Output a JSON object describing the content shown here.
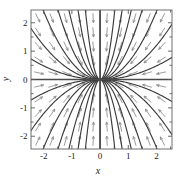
{
  "figure": {
    "kind": "direction-field-phase-portrait",
    "background": "#ffffff"
  },
  "chart_data": {
    "type": "scatter",
    "title": "",
    "subtitle": "",
    "xlabel": "x",
    "ylabel": "y",
    "xlim": [
      -2.45,
      2.55
    ],
    "ylim": [
      -2.45,
      2.45
    ],
    "xticks": [
      -2,
      -1,
      0,
      1,
      2
    ],
    "xticklabels": [
      "-2",
      "-1",
      "0",
      "1",
      "2"
    ],
    "yticks": [
      -2,
      -1,
      0,
      1,
      2
    ],
    "yticklabels": [
      "-2",
      "-1",
      "0",
      "1",
      "2"
    ],
    "minor_tick_step": 0.5,
    "grid": false,
    "legend": null,
    "annotations": [],
    "field": {
      "description": "direction field of a stable node (sink) at the origin",
      "equilibrium": [
        0,
        0
      ],
      "equilibrium_type": "stable node / sink",
      "dx": "-x",
      "dy": "-2*y",
      "arrow_color": "#8a8a8a",
      "arrow_grid_x": [
        -2.25,
        -1.75,
        -1.25,
        -0.75,
        -0.25,
        0.25,
        0.75,
        1.25,
        1.75,
        2.25
      ],
      "arrow_grid_y": [
        -2.25,
        -1.75,
        -1.25,
        -0.75,
        -0.25,
        0.25,
        0.75,
        1.25,
        1.75,
        2.25
      ]
    },
    "trajectories": {
      "color": "#3c3c3c",
      "family": "y = C * x^2 (plus the x-axis and y-axis separatrices)",
      "curve_constants": [
        -9.0,
        -4.0,
        -2.0,
        -1.1,
        -0.6,
        -0.3,
        -0.12,
        0.12,
        0.3,
        0.6,
        1.1,
        2.0,
        4.0,
        9.0
      ],
      "includes_x_axis": true,
      "includes_y_axis": true
    },
    "axis_color": "#4a4a4a",
    "frame_color": "#6e6e6e"
  },
  "labels": {
    "x_axis": "x",
    "y_axis": "y",
    "x_ticks": [
      "-2",
      "-1",
      "0",
      "1",
      "2"
    ],
    "y_ticks": [
      "2",
      "1",
      "0",
      "-1",
      "-2"
    ]
  }
}
